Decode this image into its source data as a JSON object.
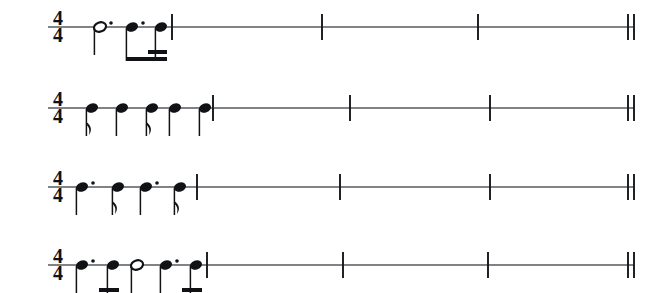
{
  "document": {
    "type": "music-notation-worksheet",
    "title": "Rhythm reading exercises",
    "staff_type": "single-line rhythm staff",
    "systems_count": 4,
    "colors": {
      "ink": "#101215",
      "staff_line": "#555a5e",
      "background": "#ffffff"
    }
  },
  "systems": [
    {
      "label": "a.",
      "time_signature": {
        "numerator": "4",
        "denominator": "4",
        "display": "4/4"
      },
      "staff_y": 27,
      "staff_x_start": 48,
      "staff_x_end": 634,
      "barlines": [
        172,
        322,
        478,
        628
      ],
      "final_double_barline": [
        628,
        634
      ],
      "notes": [
        {
          "name": "dotted-half-note",
          "duration": "dotted half",
          "beats": 3,
          "x": 100,
          "head": "open",
          "stem": "down",
          "dotted": true,
          "flags": 0,
          "beamed": false
        },
        {
          "name": "dotted-eighth-note",
          "duration": "dotted eighth",
          "beats": 0.75,
          "x": 132,
          "head": "filled",
          "stem": "down",
          "dotted": true,
          "flags": 1,
          "beamed": true,
          "beam_group": 1
        },
        {
          "name": "sixteenth-note",
          "duration": "sixteenth",
          "beats": 0.25,
          "x": 161,
          "head": "filled",
          "stem": "down",
          "dotted": false,
          "flags": 2,
          "beamed": true,
          "beam_group": 1
        }
      ],
      "beam_groups": [
        {
          "id": 1,
          "x_start": 126,
          "x_end": 167,
          "beams": 1,
          "secondary_beam": {
            "x_start": 148,
            "x_end": 167
          }
        }
      ]
    },
    {
      "label": "b.",
      "time_signature": {
        "numerator": "4",
        "denominator": "4",
        "display": "4/4"
      },
      "staff_y": 108,
      "staff_x_start": 48,
      "staff_x_end": 634,
      "barlines": [
        213,
        350,
        490,
        628
      ],
      "final_double_barline": [
        628,
        634
      ],
      "notes": [
        {
          "name": "eighth-note",
          "duration": "eighth",
          "beats": 0.5,
          "x": 92,
          "head": "filled",
          "stem": "down",
          "dotted": false,
          "flags": 1,
          "beamed": false
        },
        {
          "name": "quarter-note",
          "duration": "quarter",
          "beats": 1,
          "x": 122,
          "head": "filled",
          "stem": "down",
          "dotted": false,
          "flags": 0,
          "beamed": false
        },
        {
          "name": "eighth-note",
          "duration": "eighth",
          "beats": 0.5,
          "x": 152,
          "head": "filled",
          "stem": "down",
          "dotted": false,
          "flags": 1,
          "beamed": false
        },
        {
          "name": "quarter-note",
          "duration": "quarter",
          "beats": 1,
          "x": 175,
          "head": "filled",
          "stem": "down",
          "dotted": false,
          "flags": 0,
          "beamed": false
        },
        {
          "name": "quarter-note",
          "duration": "quarter",
          "beats": 1,
          "x": 205,
          "head": "filled",
          "stem": "down",
          "dotted": false,
          "flags": 0,
          "beamed": false
        }
      ],
      "beam_groups": []
    },
    {
      "label": "c.",
      "time_signature": {
        "numerator": "4",
        "denominator": "4",
        "display": "4/4"
      },
      "staff_y": 187,
      "staff_x_start": 48,
      "staff_x_end": 634,
      "barlines": [
        197,
        340,
        490,
        628
      ],
      "final_double_barline": [
        628,
        634
      ],
      "notes": [
        {
          "name": "dotted-quarter-note",
          "duration": "dotted quarter",
          "beats": 1.5,
          "x": 82,
          "head": "filled",
          "stem": "down",
          "dotted": true,
          "flags": 0,
          "beamed": false
        },
        {
          "name": "eighth-note",
          "duration": "eighth",
          "beats": 0.5,
          "x": 118,
          "head": "filled",
          "stem": "down",
          "dotted": false,
          "flags": 1,
          "beamed": false
        },
        {
          "name": "dotted-quarter-note",
          "duration": "dotted quarter",
          "beats": 1.5,
          "x": 146,
          "head": "filled",
          "stem": "down",
          "dotted": true,
          "flags": 0,
          "beamed": false
        },
        {
          "name": "eighth-note",
          "duration": "eighth",
          "beats": 0.5,
          "x": 180,
          "head": "filled",
          "stem": "down",
          "dotted": false,
          "flags": 1,
          "beamed": false
        }
      ],
      "beam_groups": []
    },
    {
      "label": "d.",
      "time_signature": {
        "numerator": "4",
        "denominator": "4",
        "display": "4/4"
      },
      "staff_y": 265,
      "staff_x_start": 48,
      "staff_x_end": 634,
      "barlines": [
        207,
        343,
        488,
        628
      ],
      "final_double_barline": [
        628,
        634
      ],
      "notes": [
        {
          "name": "dotted-eighth-note",
          "duration": "dotted eighth",
          "beats": 0.75,
          "x": 82,
          "head": "filled",
          "stem": "down",
          "dotted": true,
          "flags": 1,
          "beamed": true,
          "beam_group": 1
        },
        {
          "name": "sixteenth-note",
          "duration": "sixteenth",
          "beats": 0.25,
          "x": 113,
          "head": "filled",
          "stem": "down",
          "dotted": false,
          "flags": 2,
          "beamed": true,
          "beam_group": 1
        },
        {
          "name": "half-note",
          "duration": "half",
          "beats": 2,
          "x": 137,
          "head": "open",
          "stem": "down",
          "dotted": false,
          "flags": 0,
          "beamed": false
        },
        {
          "name": "dotted-eighth-note",
          "duration": "dotted eighth",
          "beats": 0.75,
          "x": 166,
          "head": "filled",
          "stem": "down",
          "dotted": true,
          "flags": 1,
          "beamed": true,
          "beam_group": 2
        },
        {
          "name": "sixteenth-note",
          "duration": "sixteenth",
          "beats": 0.25,
          "x": 196,
          "head": "filled",
          "stem": "down",
          "dotted": false,
          "flags": 2,
          "beamed": true,
          "beam_group": 2
        }
      ],
      "beam_groups": [
        {
          "id": 1,
          "x_start": 76,
          "x_end": 119,
          "beams": 1,
          "secondary_beam": {
            "x_start": 99,
            "x_end": 119
          }
        },
        {
          "id": 2,
          "x_start": 160,
          "x_end": 202,
          "beams": 1,
          "secondary_beam": {
            "x_start": 182,
            "x_end": 202
          }
        }
      ]
    }
  ]
}
